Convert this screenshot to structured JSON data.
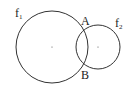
{
  "diagram": {
    "circles": [
      {
        "name": "f",
        "subscript": "1",
        "cx": 52,
        "cy": 47,
        "r": 36,
        "label_x": 15,
        "label_y": 16
      },
      {
        "name": "f",
        "subscript": "2",
        "cx": 98,
        "cy": 47,
        "r": 22,
        "label_x": 115,
        "label_y": 26
      }
    ],
    "points": [
      {
        "label": "A",
        "x": 84,
        "y": 26,
        "label_x": 81,
        "label_y": 24
      },
      {
        "label": "B",
        "x": 84,
        "y": 68,
        "label_x": 81,
        "label_y": 79
      }
    ],
    "stroke_color": "#333333"
  }
}
